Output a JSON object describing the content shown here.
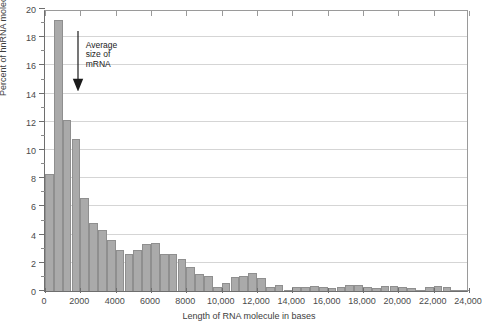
{
  "chart_data": {
    "type": "bar",
    "title": "",
    "xlabel": "Length of RNA molecule in bases",
    "ylabel": "Percent of hnRNA molecules",
    "xlim": [
      0,
      24000
    ],
    "ylim": [
      0,
      20
    ],
    "grid": true,
    "legend": null,
    "bin_width": 500,
    "xticks": [
      0,
      2000,
      4000,
      6000,
      8000,
      10000,
      12000,
      14000,
      16000,
      18000,
      20000,
      22000,
      24000
    ],
    "xtick_labels": [
      "0",
      "2000",
      "4000",
      "6000",
      "8000",
      "10,000",
      "12,000",
      "14,000",
      "16,000",
      "18,000",
      "20,000",
      "22,000",
      "24,000"
    ],
    "yticks": [
      0,
      2,
      4,
      6,
      8,
      10,
      12,
      14,
      16,
      18,
      20
    ],
    "ytick_labels": [
      "0",
      "2",
      "4",
      "6",
      "8",
      "10",
      "12",
      "14",
      "16",
      "18",
      "20"
    ],
    "yticks_minor": [
      1,
      3,
      5,
      7,
      9,
      11,
      13,
      15,
      17,
      19
    ],
    "categories": [
      250,
      750,
      1250,
      1750,
      2250,
      2750,
      3250,
      3750,
      4250,
      4750,
      5250,
      5750,
      6250,
      6750,
      7250,
      7750,
      8250,
      8750,
      9250,
      9750,
      10250,
      10750,
      11250,
      11750,
      12250,
      12750,
      13250,
      13750,
      14250,
      14750,
      15250,
      15750,
      16250,
      16750,
      17250,
      17750,
      18250,
      18750,
      19250,
      19750,
      20250,
      20750,
      21250,
      21750,
      22250,
      22750,
      23250,
      23750
    ],
    "values": [
      8.3,
      19.2,
      12.1,
      10.8,
      6.6,
      4.8,
      4.3,
      3.6,
      2.9,
      2.6,
      2.9,
      3.3,
      3.4,
      2.6,
      2.6,
      2.3,
      1.7,
      1.2,
      1.1,
      0.3,
      0.6,
      1.0,
      1.1,
      1.3,
      0.9,
      0.3,
      0.4,
      0.1,
      0.25,
      0.3,
      0.35,
      0.3,
      0.2,
      0.3,
      0.45,
      0.4,
      0.3,
      0.2,
      0.35,
      0.35,
      0.3,
      0.2,
      0.1,
      0.3,
      0.35,
      0.25,
      0.05,
      0.05
    ]
  },
  "annotation": {
    "label": "Average\nsize of\nmRNA",
    "arrow_x": 1850,
    "arrow_top_y": 18.6,
    "arrow_bottom_y": 14.3,
    "icon": "down-arrow-icon"
  },
  "colors": {
    "bar_fill": "#aaaaaa",
    "bar_edge": "#8f8f8f",
    "gridline": "#d5d5d5",
    "axis": "#6e6e6e",
    "text": "#3d3d3d",
    "background": "#ffffff"
  }
}
